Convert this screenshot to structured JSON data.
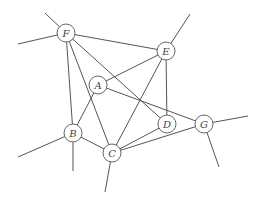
{
  "diagram": {
    "type": "graph",
    "nodes": [
      {
        "id": "F",
        "label": "F",
        "x": 66,
        "y": 33
      },
      {
        "id": "E",
        "label": "E",
        "x": 166,
        "y": 51
      },
      {
        "id": "A",
        "label": "A",
        "x": 98,
        "y": 85
      },
      {
        "id": "B",
        "label": "B",
        "x": 73,
        "y": 133
      },
      {
        "id": "C",
        "label": "C",
        "x": 112,
        "y": 153
      },
      {
        "id": "D",
        "label": "D",
        "x": 167,
        "y": 124
      },
      {
        "id": "G",
        "label": "G",
        "x": 204,
        "y": 124
      }
    ],
    "edges": [
      [
        "F",
        "E"
      ],
      [
        "F",
        "B"
      ],
      [
        "F",
        "C"
      ],
      [
        "F",
        "D"
      ],
      [
        "A",
        "E"
      ],
      [
        "A",
        "B"
      ],
      [
        "A",
        "G"
      ],
      [
        "E",
        "C"
      ],
      [
        "E",
        "D"
      ],
      [
        "C",
        "B"
      ],
      [
        "C",
        "D"
      ],
      [
        "C",
        "G"
      ]
    ],
    "stubs": [
      {
        "from": "F",
        "x": 45,
        "y": 13
      },
      {
        "from": "F",
        "x": 18,
        "y": 44
      },
      {
        "from": "E",
        "x": 190,
        "y": 14
      },
      {
        "from": "B",
        "x": 18,
        "y": 157
      },
      {
        "from": "B",
        "x": 73,
        "y": 171
      },
      {
        "from": "C",
        "x": 105,
        "y": 192
      },
      {
        "from": "G",
        "x": 248,
        "y": 116
      },
      {
        "from": "G",
        "x": 219,
        "y": 167
      }
    ],
    "node_radius": 9,
    "colors": {
      "edge": "#555555",
      "node_stroke": "#666666",
      "label": "#444444",
      "background": "#ffffff"
    }
  }
}
